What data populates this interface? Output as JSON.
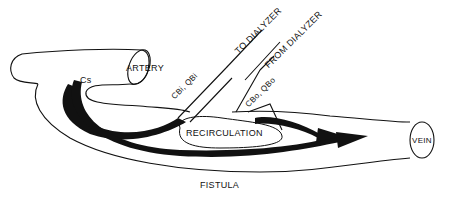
{
  "diagram": {
    "labels": {
      "artery": "ARTERY",
      "vein": "VEIN",
      "fistula": "FISTULA",
      "recirculation": "RECIRCULATION",
      "to_dialyzer": "TO DIALYZER",
      "from_dialyzer": "FROM DIALYZER",
      "cs": "Cs",
      "cb_in": "CBi, QBi",
      "cb_out": "CBo, QBo"
    },
    "colors": {
      "line": "#111111",
      "background": "#ffffff"
    }
  }
}
